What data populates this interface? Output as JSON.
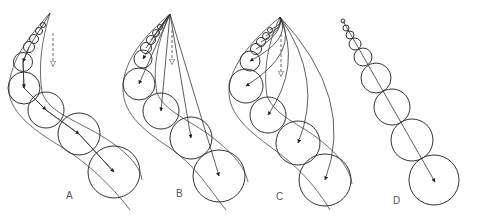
{
  "figure": {
    "stroke_color": "#333333",
    "background": "#ffffff"
  },
  "panels": [
    {
      "id": "A",
      "label": "A",
      "label_pos": [
        70,
        198
      ],
      "tip": [
        50,
        13
      ],
      "dashed_arrow": {
        "x": 53,
        "y1": 33,
        "y2": 66
      },
      "circles": [
        {
          "cx": 43,
          "cy": 25,
          "r": 2.5
        },
        {
          "cx": 39,
          "cy": 31,
          "r": 3.5
        },
        {
          "cx": 34,
          "cy": 39,
          "r": 4.5
        },
        {
          "cx": 29,
          "cy": 47,
          "r": 5.5
        },
        {
          "cx": 23,
          "cy": 62,
          "r": 9.5
        },
        {
          "cx": 24,
          "cy": 88,
          "r": 16
        },
        {
          "cx": 46,
          "cy": 110,
          "r": 18
        },
        {
          "cx": 79,
          "cy": 134,
          "r": 21
        },
        {
          "cx": 114,
          "cy": 172,
          "r": 26
        }
      ],
      "arrow_mode": "chain"
    },
    {
      "id": "B",
      "label": "B",
      "label_pos": [
        180,
        196
      ],
      "tip": [
        170,
        14
      ],
      "dashed_arrow": {
        "x": 172,
        "y1": 30,
        "y2": 64
      },
      "circles": [
        {
          "cx": 160,
          "cy": 27,
          "r": 2.5
        },
        {
          "cx": 156,
          "cy": 33,
          "r": 3.5
        },
        {
          "cx": 151,
          "cy": 40,
          "r": 4.5
        },
        {
          "cx": 146,
          "cy": 48,
          "r": 5.5
        },
        {
          "cx": 143,
          "cy": 59,
          "r": 9
        },
        {
          "cx": 139,
          "cy": 84,
          "r": 16
        },
        {
          "cx": 161,
          "cy": 111,
          "r": 18
        },
        {
          "cx": 191,
          "cy": 138,
          "r": 21
        },
        {
          "cx": 219,
          "cy": 176,
          "r": 26
        }
      ],
      "arrow_mode": "radial-straight"
    },
    {
      "id": "C",
      "label": "C",
      "label_pos": [
        280,
        199
      ],
      "tip": [
        280,
        17
      ],
      "dashed_arrow": {
        "x": 281,
        "y1": 34,
        "y2": 76
      },
      "circles": [
        {
          "cx": 270,
          "cy": 30,
          "r": 2.5
        },
        {
          "cx": 266,
          "cy": 36,
          "r": 3.5
        },
        {
          "cx": 261,
          "cy": 42,
          "r": 4.5
        },
        {
          "cx": 256,
          "cy": 49,
          "r": 5.5
        },
        {
          "cx": 250,
          "cy": 61,
          "r": 10
        },
        {
          "cx": 246,
          "cy": 86,
          "r": 17
        },
        {
          "cx": 268,
          "cy": 115,
          "r": 18
        },
        {
          "cx": 298,
          "cy": 143,
          "r": 22
        },
        {
          "cx": 325,
          "cy": 180,
          "r": 26
        }
      ],
      "arrow_mode": "radial-curved"
    },
    {
      "id": "D",
      "label": "D",
      "label_pos": [
        397,
        203
      ],
      "tip": [
        343,
        21
      ],
      "circles": [
        {
          "cx": 343,
          "cy": 21,
          "r": 2
        },
        {
          "cx": 346,
          "cy": 28,
          "r": 3
        },
        {
          "cx": 350,
          "cy": 35,
          "r": 4
        },
        {
          "cx": 355,
          "cy": 44,
          "r": 6
        },
        {
          "cx": 363,
          "cy": 57,
          "r": 9
        },
        {
          "cx": 376,
          "cy": 78,
          "r": 15
        },
        {
          "cx": 392,
          "cy": 107,
          "r": 18
        },
        {
          "cx": 412,
          "cy": 140,
          "r": 21
        },
        {
          "cx": 434,
          "cy": 180,
          "r": 25
        }
      ],
      "arrow_mode": "single-line",
      "arrow_end": [
        435,
        182
      ]
    }
  ]
}
